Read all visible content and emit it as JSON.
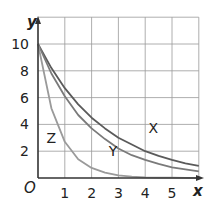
{
  "chart_data": {
    "type": "line",
    "title": "",
    "xlabel": "x",
    "ylabel": "y",
    "origin_label": "O",
    "xlim": [
      0,
      6
    ],
    "ylim": [
      0,
      12
    ],
    "grid": true,
    "x_ticks": [
      1,
      2,
      3,
      4,
      5
    ],
    "y_ticks": [
      2,
      4,
      6,
      8,
      10
    ],
    "x": [
      0,
      0.5,
      1,
      1.5,
      2,
      2.5,
      3,
      3.5,
      4,
      4.5,
      5,
      5.5,
      6
    ],
    "series": [
      {
        "name": "X",
        "values": [
          10,
          8.2,
          6.7,
          5.5,
          4.5,
          3.7,
          3.0,
          2.5,
          2.0,
          1.65,
          1.35,
          1.1,
          0.9
        ],
        "color": "#5a5a5a"
      },
      {
        "name": "Y",
        "values": [
          10,
          7.8,
          6.1,
          4.7,
          3.7,
          2.9,
          2.2,
          1.7,
          1.35,
          1.05,
          0.8,
          0.65,
          0.5
        ],
        "color": "#7a7a7a"
      },
      {
        "name": "Z",
        "values": [
          10,
          5.2,
          2.7,
          1.4,
          0.75,
          0.4,
          0.2,
          0.1,
          0.05,
          0.03,
          0.02,
          0.01,
          0.0
        ],
        "color": "#9a9a9a"
      }
    ],
    "annotations": [
      {
        "text": "X",
        "x": 4.3,
        "y": 3.7
      },
      {
        "text": "Y",
        "x": 2.8,
        "y": 2.0
      },
      {
        "text": "Z",
        "x": 0.5,
        "y": 3.0
      }
    ]
  }
}
